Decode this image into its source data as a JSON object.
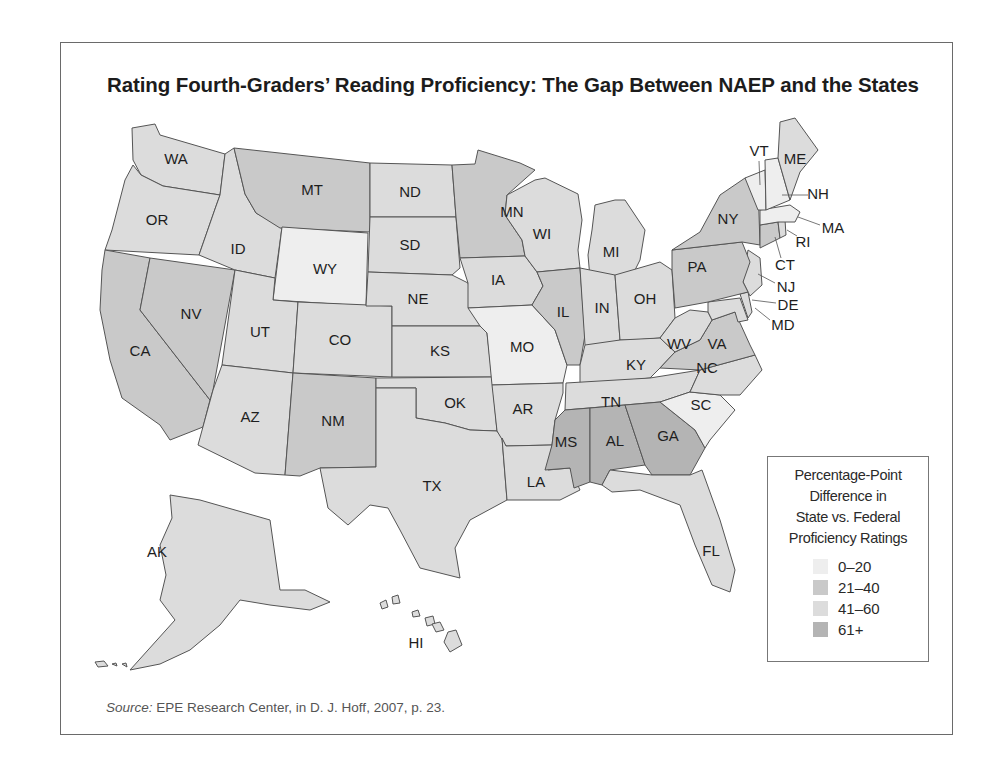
{
  "title": "Rating Fourth-Graders’ Reading Proficiency: The Gap Between NAEP and the States",
  "source": {
    "label": "Source:",
    "text": " EPE Research Center, in D. J. Hoff, 2007, p. 23."
  },
  "legend": {
    "title_lines": [
      "Percentage-Point",
      "Difference in",
      "State vs. Federal",
      "Proficiency Ratings"
    ],
    "items": [
      {
        "key": "a",
        "label": "0–20",
        "color": "#eeeeee"
      },
      {
        "key": "b",
        "label": "21–40",
        "color": "#c9c9c9"
      },
      {
        "key": "c",
        "label": "41–60",
        "color": "#dcdcdc"
      },
      {
        "key": "d",
        "label": "61+",
        "color": "#b4b4b4"
      }
    ]
  },
  "chart_data": {
    "type": "choropleth",
    "title": "Rating Fourth-Graders’ Reading Proficiency: The Gap Between NAEP and the States",
    "legend_title": "Percentage-Point Difference in State vs. Federal Proficiency Ratings",
    "categories": [
      "0–20",
      "21–40",
      "41–60",
      "61+"
    ],
    "states": {
      "WA": "41–60",
      "OR": "41–60",
      "CA": "21–40",
      "NV": "21–40",
      "ID": "41–60",
      "MT": "21–40",
      "WY": "0–20",
      "UT": "41–60",
      "CO": "41–60",
      "AZ": "41–60",
      "NM": "21–40",
      "ND": "41–60",
      "SD": "41–60",
      "NE": "41–60",
      "KS": "41–60",
      "OK": "41–60",
      "TX": "41–60",
      "MN": "21–40",
      "IA": "41–60",
      "MO": "0–20",
      "AR": "41–60",
      "LA": "41–60",
      "WI": "41–60",
      "IL": "21–40",
      "MI": "41–60",
      "IN": "41–60",
      "OH": "41–60",
      "KY": "41–60",
      "TN": "41–60",
      "MS": "61+",
      "AL": "61+",
      "GA": "61+",
      "FL": "41–60",
      "SC": "0–20",
      "NC": "41–60",
      "VA": "21–40",
      "WV": "41–60",
      "MD": "41–60",
      "DE": "41–60",
      "NJ": "41–60",
      "PA": "21–40",
      "NY": "21–40",
      "CT": "21–40",
      "RI": "41–60",
      "MA": "0–20",
      "VT": "0–20",
      "NH": "0–20",
      "ME": "41–60",
      "AK": "41–60",
      "HI": "41–60"
    },
    "source": "EPE Research Center, in D. J. Hoff, 2007, p. 23."
  },
  "map": {
    "states": [
      {
        "id": "WA",
        "cat": "c",
        "lx": 176,
        "ly": 160,
        "pts": "132,128 155,124 160,135 225,154 220,195 163,186 141,175 133,160"
      },
      {
        "id": "OR",
        "cat": "c",
        "lx": 157,
        "ly": 221,
        "pts": "133,165 141,175 163,186 220,195 215,209 199,255 105,250 112,230 125,180"
      },
      {
        "id": "CA",
        "cat": "b",
        "lx": 140,
        "ly": 352,
        "pts": "105,250 150,258 140,310 210,400 203,427 170,440 160,425 122,398 110,360 100,310 102,270"
      },
      {
        "id": "NV",
        "cat": "b",
        "lx": 191,
        "ly": 315,
        "pts": "150,258 235,270 213,390 210,400 140,310"
      },
      {
        "id": "ID",
        "cat": "c",
        "lx": 238,
        "ly": 250,
        "pts": "225,154 234,148 245,194 256,213 282,227 275,278 235,270 199,255 215,209 220,195"
      },
      {
        "id": "MT",
        "cat": "b",
        "lx": 312,
        "ly": 191,
        "pts": "234,148 370,163 370,232 280,228 256,213 245,194"
      },
      {
        "id": "WY",
        "cat": "a",
        "lx": 325,
        "ly": 270,
        "pts": "282,227 368,233 366,306 273,300"
      },
      {
        "id": "UT",
        "cat": "c",
        "lx": 260,
        "ly": 333,
        "pts": "235,270 275,278 273,300 298,302 293,373 222,365"
      },
      {
        "id": "CO",
        "cat": "c",
        "lx": 340,
        "ly": 341,
        "pts": "298,302 392,306 392,377 293,373"
      },
      {
        "id": "AZ",
        "cat": "c",
        "lx": 250,
        "ly": 418,
        "pts": "222,365 293,373 285,475 255,473 198,445 213,390"
      },
      {
        "id": "NM",
        "cat": "b",
        "lx": 333,
        "ly": 422,
        "pts": "293,373 376,378 376,467 320,468 300,476 285,475"
      },
      {
        "id": "ND",
        "cat": "c",
        "lx": 410,
        "ly": 193,
        "pts": "370,163 452,165 456,217 370,217"
      },
      {
        "id": "SD",
        "cat": "c",
        "lx": 410,
        "ly": 246,
        "pts": "370,217 456,217 460,268 452,275 368,272"
      },
      {
        "id": "NE",
        "cat": "c",
        "lx": 418,
        "ly": 300,
        "pts": "368,272 452,275 468,283 480,326 392,326 392,306 366,306"
      },
      {
        "id": "KS",
        "cat": "c",
        "lx": 440,
        "ly": 352,
        "pts": "392,326 480,326 487,333 492,377 392,377"
      },
      {
        "id": "OK",
        "cat": "c",
        "lx": 455,
        "ly": 404,
        "pts": "376,378 492,377 497,431 470,430 445,423 416,418 416,388 376,388"
      },
      {
        "id": "TX",
        "cat": "c",
        "lx": 432,
        "ly": 487,
        "pts": "376,388 416,388 416,418 445,423 470,430 497,431 502,438 507,500 470,520 455,548 460,578 420,568 400,530 388,508 370,505 348,525 328,508 320,468 376,467"
      },
      {
        "id": "MN",
        "cat": "b",
        "lx": 512,
        "ly": 213,
        "pts": "452,165 475,164 478,150 520,163 535,170 507,195 505,215 522,240 525,256 460,258 456,217"
      },
      {
        "id": "IA",
        "cat": "c",
        "lx": 498,
        "ly": 281,
        "pts": "460,258 525,256 537,272 543,286 532,305 468,308 468,283"
      },
      {
        "id": "MO",
        "cat": "a",
        "lx": 522,
        "ly": 348,
        "pts": "468,308 532,305 555,330 567,365 563,383 492,385 487,333 480,326"
      },
      {
        "id": "AR",
        "cat": "c",
        "lx": 523,
        "ly": 410,
        "pts": "492,385 563,383 563,393 555,420 552,445 506,446 497,431"
      },
      {
        "id": "LA",
        "cat": "c",
        "lx": 536,
        "ly": 483,
        "pts": "506,446 552,445 548,470 570,468 580,490 560,500 520,500 507,500 502,438"
      },
      {
        "id": "WI",
        "cat": "c",
        "lx": 542,
        "ly": 235,
        "pts": "507,195 535,180 545,178 578,194 582,220 578,250 580,268 537,272 525,256 522,240 505,215"
      },
      {
        "id": "IL",
        "cat": "b",
        "lx": 563,
        "ly": 313,
        "pts": "537,272 580,268 585,335 580,365 567,365 555,330 532,305 543,286"
      },
      {
        "id": "MI",
        "cat": "c",
        "lx": 611,
        "ly": 253,
        "pts": "595,205 615,200 625,200 645,230 640,260 632,276 590,278 588,255 592,230"
      },
      {
        "id": "IN",
        "cat": "c",
        "lx": 602,
        "ly": 309,
        "pts": "580,268 615,275 620,340 595,352 585,345"
      },
      {
        "id": "OH",
        "cat": "c",
        "lx": 645,
        "ly": 300,
        "pts": "615,275 660,262 672,270 675,318 660,338 635,340 620,340"
      },
      {
        "id": "KY",
        "cat": "c",
        "lx": 636,
        "ly": 366,
        "pts": "580,365 585,345 620,340 660,338 675,352 660,368 650,378 580,385"
      },
      {
        "id": "TN",
        "cat": "c",
        "lx": 611,
        "ly": 403,
        "pts": "566,383 650,378 700,370 690,392 660,402 565,410"
      },
      {
        "id": "MS",
        "cat": "d",
        "lx": 566,
        "ly": 443,
        "pts": "565,410 590,408 590,482 574,488 570,468 545,470 552,445 555,420"
      },
      {
        "id": "AL",
        "cat": "d",
        "lx": 615,
        "ly": 442,
        "pts": "590,408 625,405 645,465 610,470 602,485 590,482"
      },
      {
        "id": "GA",
        "cat": "d",
        "lx": 668,
        "ly": 437,
        "pts": "625,405 660,402 695,430 705,448 690,475 652,475 645,465"
      },
      {
        "id": "FL",
        "cat": "c",
        "lx": 711,
        "ly": 552,
        "pts": "602,485 610,470 652,475 690,475 702,470 720,520 735,570 730,592 712,585 695,545 680,505 640,490 612,492"
      },
      {
        "id": "SC",
        "cat": "a",
        "lx": 701,
        "ly": 406,
        "pts": "660,402 690,392 720,395 735,410 710,440 705,448 695,430"
      },
      {
        "id": "NC",
        "cat": "c",
        "lx": 707,
        "ly": 369,
        "pts": "700,370 755,355 762,370 740,395 720,395 690,392"
      },
      {
        "id": "VA",
        "cat": "b",
        "lx": 717,
        "ly": 345,
        "pts": "660,368 675,352 700,340 712,320 735,312 750,345 755,355 700,370"
      },
      {
        "id": "WV",
        "cat": "c",
        "lx": 679,
        "ly": 345,
        "pts": "675,318 690,310 708,312 712,320 700,340 675,352 660,338"
      },
      {
        "id": "MD",
        "cat": "c",
        "lx": 742,
        "ly": 318,
        "pts": "708,302 740,298 748,320 738,322 735,312 712,320 708,312"
      },
      {
        "id": "DE",
        "cat": "c",
        "lx": 749,
        "ly": 305,
        "pts": "740,294 748,292 752,312 748,318"
      },
      {
        "id": "NJ",
        "cat": "c",
        "lx": 754,
        "ly": 278,
        "pts": "748,250 760,258 762,285 750,296 743,282"
      },
      {
        "id": "PA",
        "cat": "b",
        "lx": 697,
        "ly": 268,
        "pts": "672,250 742,242 750,262 743,282 748,292 708,302 675,308 672,270"
      },
      {
        "id": "NY",
        "cat": "b",
        "lx": 728,
        "ly": 220,
        "pts": "672,250 700,232 720,195 745,178 758,184 760,245 742,242"
      },
      {
        "id": "CT",
        "cat": "b",
        "lx": 769,
        "ly": 230,
        "pts": "760,225 778,222 780,238 760,248"
      },
      {
        "id": "RI",
        "cat": "c",
        "lx": 785,
        "ly": 232,
        "pts": "778,222 785,220 786,235 780,238"
      },
      {
        "id": "MA",
        "cat": "a",
        "lx": 780,
        "ly": 212,
        "pts": "760,210 790,205 800,212 795,222 778,222 760,225"
      },
      {
        "id": "VT",
        "cat": "a",
        "lx": 756,
        "ly": 180,
        "pts": "745,178 765,170 766,210 758,210"
      },
      {
        "id": "NH",
        "cat": "a",
        "lx": 778,
        "ly": 190,
        "pts": "765,160 778,158 790,200 766,210"
      },
      {
        "id": "ME",
        "cat": "c",
        "lx": 795,
        "ly": 160,
        "pts": "778,158 780,122 795,118 818,150 800,172 790,200"
      },
      {
        "id": "AK",
        "cat": "c",
        "lx": 157,
        "ly": 553,
        "pts": "170,495 200,500 270,520 280,590 305,590 330,602 310,610 270,605 240,600 220,625 190,650 160,664 130,670 148,650 175,620 160,600 166,575 160,545 172,518"
      },
      {
        "id": "HI",
        "cat": "c",
        "lx": 416,
        "ly": 644,
        "pts": "448,632 456,630 462,645 450,652 444,642"
      }
    ],
    "extra_labels": [
      {
        "id": "VT",
        "x": 759,
        "y": 152,
        "lx1": 759,
        "ly1": 161,
        "lx2": 760,
        "ly2": 185
      },
      {
        "id": "NH",
        "x": 818,
        "y": 195,
        "lx1": 808,
        "ly1": 195,
        "lx2": 782,
        "ly2": 195
      },
      {
        "id": "MA",
        "x": 833,
        "y": 229,
        "lx1": 820,
        "ly1": 225,
        "lx2": 798,
        "ly2": 217
      },
      {
        "id": "RI",
        "x": 803,
        "y": 243,
        "lx1": 797,
        "ly1": 236,
        "lx2": 787,
        "ly2": 230
      },
      {
        "id": "CT",
        "x": 785,
        "y": 266,
        "lx1": 781,
        "ly1": 258,
        "lx2": 775,
        "ly2": 237
      },
      {
        "id": "NJ",
        "x": 786,
        "y": 288,
        "lx1": 775,
        "ly1": 283,
        "lx2": 758,
        "ly2": 274
      },
      {
        "id": "DE",
        "x": 788,
        "y": 306,
        "lx1": 776,
        "ly1": 303,
        "lx2": 752,
        "ly2": 300
      },
      {
        "id": "MD",
        "x": 783,
        "y": 326,
        "lx1": 770,
        "ly1": 320,
        "lx2": 755,
        "ly2": 308
      }
    ],
    "islands": [
      {
        "pts": "380,603 386,600 388,607 382,609"
      },
      {
        "pts": "392,597 398,595 400,603 393,604"
      },
      {
        "pts": "412,612 418,610 420,616 413,617"
      },
      {
        "pts": "425,618 433,616 435,624 427,626"
      },
      {
        "pts": "432,624 440,622 444,630 436,632"
      },
      {
        "pts": "95,662 104,661 108,666 98,667"
      },
      {
        "pts": "112,664 116,663 117,666"
      },
      {
        "pts": "122,664 126,663 127,667"
      }
    ]
  }
}
